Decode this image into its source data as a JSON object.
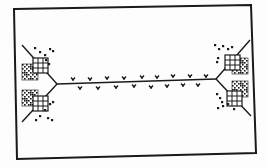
{
  "figure": {
    "width": 268,
    "height": 167,
    "background": "#fdfdfd",
    "ink": "#1a1a1a",
    "frame": {
      "points": [
        [
          14,
          9
        ],
        [
          251,
          5
        ],
        [
          256,
          153
        ],
        [
          17,
          159
        ]
      ],
      "stroke_width": 2
    },
    "trunk": {
      "from": [
        57,
        84
      ],
      "to": [
        216,
        79
      ],
      "marks_above": [
        [
          73,
          79
        ],
        [
          90,
          79
        ],
        [
          107,
          78
        ],
        [
          124,
          78
        ],
        [
          142,
          77
        ],
        [
          157,
          77
        ],
        [
          173,
          76
        ],
        [
          190,
          76
        ],
        [
          206,
          76
        ]
      ],
      "marks_below": [
        [
          80,
          88
        ],
        [
          98,
          88
        ],
        [
          116,
          87
        ],
        [
          134,
          86
        ],
        [
          151,
          87
        ],
        [
          167,
          86
        ],
        [
          183,
          85
        ],
        [
          198,
          85
        ]
      ]
    },
    "branches": [
      {
        "id": "left-upper",
        "from": [
          57,
          84
        ],
        "to": [
          22,
          45
        ]
      },
      {
        "id": "left-lower",
        "from": [
          57,
          84
        ],
        "to": [
          22,
          122
        ]
      },
      {
        "id": "right-upper",
        "from": [
          216,
          79
        ],
        "to": [
          250,
          40
        ]
      },
      {
        "id": "right-lower",
        "from": [
          216,
          79
        ],
        "to": [
          251,
          116
        ]
      }
    ],
    "grid_blocks": [
      {
        "id": "left-upper-block",
        "grid": [
          33,
          58
        ],
        "stipple": [
          22,
          64
        ],
        "dots": [
          [
            35,
            48
          ],
          [
            40,
            52
          ],
          [
            45,
            55
          ],
          [
            50,
            49
          ],
          [
            53,
            51
          ],
          [
            46,
            60
          ],
          [
            49,
            64
          ]
        ]
      },
      {
        "id": "left-lower-block",
        "grid": [
          33,
          96
        ],
        "stipple": [
          22,
          90
        ],
        "dots": [
          [
            50,
            104
          ],
          [
            53,
            102
          ],
          [
            45,
            110
          ],
          [
            40,
            116
          ],
          [
            36,
            120
          ],
          [
            48,
            118
          ],
          [
            52,
            120
          ]
        ]
      },
      {
        "id": "right-upper-block",
        "grid": [
          225,
          55
        ],
        "stipple": [
          232,
          58
        ],
        "dots": [
          [
            215,
            45
          ],
          [
            219,
            49
          ],
          [
            223,
            46
          ],
          [
            228,
            49
          ],
          [
            232,
            47
          ],
          [
            218,
            58
          ],
          [
            217,
            62
          ]
        ]
      },
      {
        "id": "right-lower-block",
        "grid": [
          227,
          91
        ],
        "stipple": [
          232,
          81
        ],
        "dots": [
          [
            217,
            94
          ],
          [
            220,
            98
          ],
          [
            222,
            102
          ],
          [
            218,
            108
          ],
          [
            223,
            106
          ],
          [
            228,
            104
          ],
          [
            234,
            109
          ]
        ]
      }
    ],
    "grid_cell": 5,
    "grid_cells": 3
  }
}
